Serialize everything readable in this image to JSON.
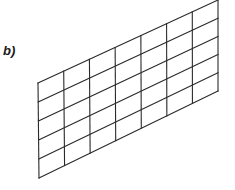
{
  "figure": {
    "label": "b)",
    "grid": {
      "columns": 7,
      "rows": 5,
      "top_left": [
        38,
        83
      ],
      "bottom_left": [
        39,
        178
      ],
      "top_right": [
        218,
        0
      ],
      "bottom_right": [
        218,
        91
      ],
      "stroke_color": "#2a2a2a",
      "stroke_width": 1.1
    }
  }
}
